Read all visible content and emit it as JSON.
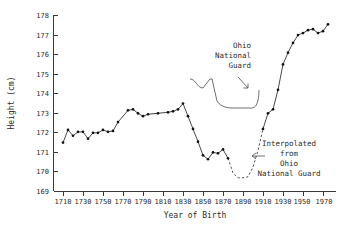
{
  "chart_data": {
    "type": "line",
    "title": "",
    "xlabel": "Year of Birth",
    "ylabel": "Height (cm)",
    "xlim": [
      1700,
      1978
    ],
    "ylim": [
      169,
      178
    ],
    "grid": false,
    "legend": null,
    "xticks": [
      1710,
      1730,
      1750,
      1770,
      1790,
      1810,
      1830,
      1850,
      1870,
      1890,
      1910,
      1930,
      1950,
      1970
    ],
    "yticks": [
      169,
      170,
      171,
      172,
      173,
      174,
      175,
      176,
      177,
      178
    ],
    "series": [
      {
        "name": "measured",
        "style": "solid-with-markers",
        "x": [
          1710,
          1715,
          1720,
          1725,
          1730,
          1735,
          1740,
          1745,
          1750,
          1755,
          1760,
          1765,
          1775,
          1780,
          1785,
          1790,
          1795,
          1805,
          1815,
          1820,
          1825,
          1830,
          1835,
          1840,
          1845,
          1850,
          1855,
          1860,
          1865,
          1870,
          1875
        ],
        "y": [
          171.5,
          172.15,
          171.85,
          172.05,
          172.05,
          171.7,
          172.0,
          172.0,
          172.15,
          172.05,
          172.1,
          172.55,
          173.15,
          173.2,
          173.0,
          172.85,
          172.95,
          173.0,
          173.05,
          173.1,
          173.2,
          173.5,
          172.85,
          172.2,
          171.55,
          170.85,
          170.65,
          171.0,
          170.95,
          171.15,
          170.7
        ]
      },
      {
        "name": "interpolated",
        "style": "dashed",
        "x": [
          1875,
          1880,
          1885,
          1890,
          1895,
          1900,
          1905,
          1910
        ],
        "y": [
          170.7,
          169.95,
          169.7,
          169.7,
          169.75,
          170.25,
          171.1,
          172.2
        ]
      },
      {
        "name": "measured-modern",
        "style": "solid-with-markers",
        "x": [
          1910,
          1915,
          1920,
          1925,
          1930,
          1935,
          1940,
          1945,
          1950,
          1955,
          1960,
          1965,
          1970,
          1975
        ],
        "y": [
          172.2,
          173.0,
          173.2,
          174.2,
          175.5,
          176.1,
          176.6,
          177.0,
          177.1,
          177.25,
          177.3,
          177.1,
          177.2,
          177.55
        ]
      }
    ],
    "annotations": [
      {
        "name": "ohio-national-guard",
        "lines": [
          "Ohio",
          "National",
          "Guard"
        ],
        "align": "right",
        "pointer": "arrow-down-right"
      },
      {
        "name": "interpolated-from-ohio-national-guard",
        "lines": [
          "Interpolated",
          "from",
          "Ohio",
          "National Guard"
        ],
        "align": "center",
        "pointer": "arrow-left"
      }
    ]
  }
}
